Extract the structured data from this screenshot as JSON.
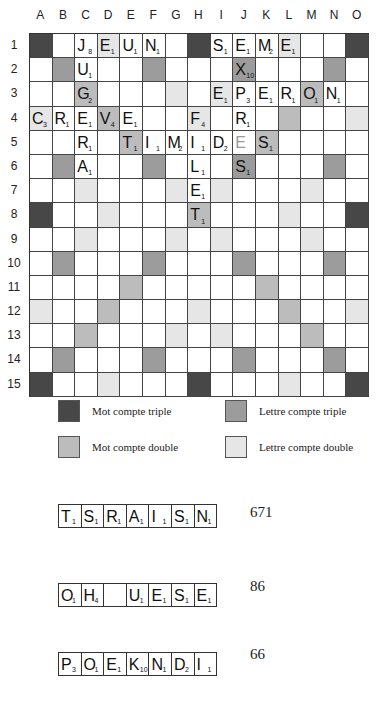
{
  "columns": [
    "A",
    "B",
    "C",
    "D",
    "E",
    "F",
    "G",
    "H",
    "I",
    "J",
    "K",
    "L",
    "M",
    "N",
    "O"
  ],
  "rows": [
    "1",
    "2",
    "3",
    "4",
    "5",
    "6",
    "7",
    "8",
    "9",
    "10",
    "11",
    "12",
    "13",
    "14",
    "15"
  ],
  "colors": {
    "TW": "#474747",
    "LT": "#9c9c9c",
    "DW": "#bcbcbc",
    "LD": "#e6e6e6"
  },
  "bonus_layout": [
    "TW..LD...TW...LD..TW",
    ""
  ],
  "bonus": [
    [
      "TW",
      "",
      "",
      "LD",
      "",
      "",
      "",
      "TW",
      "",
      "",
      "",
      "LD",
      "",
      "",
      "TW"
    ],
    [
      "",
      "LT",
      "",
      "",
      "",
      "LT",
      "",
      "",
      "",
      "LT",
      "",
      "",
      "",
      "LT",
      ""
    ],
    [
      "",
      "",
      "DW",
      "",
      "",
      "",
      "LD",
      "",
      "LD",
      "",
      "",
      "",
      "DW",
      "",
      ""
    ],
    [
      "LD",
      "",
      "",
      "DW",
      "",
      "",
      "",
      "LD",
      "",
      "",
      "",
      "DW",
      "",
      "",
      "LD"
    ],
    [
      "",
      "",
      "",
      "",
      "DW",
      "",
      "",
      "",
      "",
      "",
      "DW",
      "",
      "",
      "",
      ""
    ],
    [
      "",
      "LT",
      "",
      "",
      "",
      "LT",
      "",
      "",
      "",
      "LT",
      "",
      "",
      "",
      "LT",
      ""
    ],
    [
      "",
      "",
      "LD",
      "",
      "",
      "",
      "LD",
      "",
      "LD",
      "",
      "",
      "",
      "LD",
      "",
      ""
    ],
    [
      "TW",
      "",
      "",
      "LD",
      "",
      "",
      "",
      "DW",
      "",
      "",
      "",
      "LD",
      "",
      "",
      "TW"
    ],
    [
      "",
      "",
      "LD",
      "",
      "",
      "",
      "LD",
      "",
      "LD",
      "",
      "",
      "",
      "LD",
      "",
      ""
    ],
    [
      "",
      "LT",
      "",
      "",
      "",
      "LT",
      "",
      "",
      "",
      "LT",
      "",
      "",
      "",
      "LT",
      ""
    ],
    [
      "",
      "",
      "",
      "",
      "DW",
      "",
      "",
      "",
      "",
      "",
      "DW",
      "",
      "",
      "",
      ""
    ],
    [
      "LD",
      "",
      "",
      "DW",
      "",
      "",
      "",
      "LD",
      "",
      "",
      "",
      "DW",
      "",
      "",
      "LD"
    ],
    [
      "",
      "",
      "DW",
      "",
      "",
      "",
      "LD",
      "",
      "LD",
      "",
      "",
      "",
      "DW",
      "",
      ""
    ],
    [
      "",
      "LT",
      "",
      "",
      "",
      "LT",
      "",
      "",
      "",
      "LT",
      "",
      "",
      "",
      "LT",
      ""
    ],
    [
      "TW",
      "",
      "",
      "LD",
      "",
      "",
      "",
      "TW",
      "",
      "",
      "",
      "LD",
      "",
      "",
      "TW"
    ]
  ],
  "tiles": [
    {
      "r": 0,
      "c": 2,
      "l": "J",
      "v": "8"
    },
    {
      "r": 0,
      "c": 3,
      "l": "E",
      "v": "1"
    },
    {
      "r": 0,
      "c": 4,
      "l": "U",
      "v": "1"
    },
    {
      "r": 0,
      "c": 5,
      "l": "N",
      "v": "1"
    },
    {
      "r": 0,
      "c": 8,
      "l": "S",
      "v": "1"
    },
    {
      "r": 0,
      "c": 9,
      "l": "E",
      "v": "1"
    },
    {
      "r": 0,
      "c": 10,
      "l": "M",
      "v": "2"
    },
    {
      "r": 0,
      "c": 11,
      "l": "E",
      "v": "1"
    },
    {
      "r": 1,
      "c": 2,
      "l": "U",
      "v": "1"
    },
    {
      "r": 1,
      "c": 9,
      "l": "X",
      "v": "10"
    },
    {
      "r": 2,
      "c": 2,
      "l": "G",
      "v": "2"
    },
    {
      "r": 2,
      "c": 8,
      "l": "E",
      "v": "1"
    },
    {
      "r": 2,
      "c": 9,
      "l": "P",
      "v": "3"
    },
    {
      "r": 2,
      "c": 10,
      "l": "E",
      "v": "1"
    },
    {
      "r": 2,
      "c": 11,
      "l": "R",
      "v": "1"
    },
    {
      "r": 2,
      "c": 12,
      "l": "O",
      "v": "1"
    },
    {
      "r": 2,
      "c": 13,
      "l": "N",
      "v": "1"
    },
    {
      "r": 3,
      "c": 0,
      "l": "C",
      "v": "3"
    },
    {
      "r": 3,
      "c": 1,
      "l": "R",
      "v": "1"
    },
    {
      "r": 3,
      "c": 2,
      "l": "E",
      "v": "1"
    },
    {
      "r": 3,
      "c": 3,
      "l": "V",
      "v": "4"
    },
    {
      "r": 3,
      "c": 4,
      "l": "E",
      "v": "1"
    },
    {
      "r": 3,
      "c": 7,
      "l": "F",
      "v": "4"
    },
    {
      "r": 3,
      "c": 9,
      "l": "R",
      "v": "1"
    },
    {
      "r": 4,
      "c": 2,
      "l": "R",
      "v": "1"
    },
    {
      "r": 4,
      "c": 4,
      "l": "T",
      "v": "1"
    },
    {
      "r": 4,
      "c": 5,
      "l": "I",
      "v": "1"
    },
    {
      "r": 4,
      "c": 6,
      "l": "M",
      "v": "2"
    },
    {
      "r": 4,
      "c": 7,
      "l": "I",
      "v": "1"
    },
    {
      "r": 4,
      "c": 8,
      "l": "D",
      "v": "2"
    },
    {
      "r": 4,
      "c": 9,
      "l": "E",
      "v": "",
      "blank": true
    },
    {
      "r": 4,
      "c": 10,
      "l": "S",
      "v": "1"
    },
    {
      "r": 5,
      "c": 2,
      "l": "A",
      "v": "1"
    },
    {
      "r": 5,
      "c": 7,
      "l": "L",
      "v": "1"
    },
    {
      "r": 5,
      "c": 9,
      "l": "S",
      "v": "1"
    },
    {
      "r": 6,
      "c": 7,
      "l": "E",
      "v": "1"
    },
    {
      "r": 7,
      "c": 7,
      "l": "T",
      "v": "1"
    }
  ],
  "legend": [
    {
      "type": "TW",
      "label": "Mot compte triple"
    },
    {
      "type": "LT",
      "label": "Lettre compte triple"
    },
    {
      "type": "DW",
      "label": "Mot compte double"
    },
    {
      "type": "LD",
      "label": "Lettre compte double"
    }
  ],
  "racks": [
    {
      "tiles": [
        {
          "l": "T",
          "v": "1"
        },
        {
          "l": "S",
          "v": "1"
        },
        {
          "l": "R",
          "v": "1"
        },
        {
          "l": "A",
          "v": "1"
        },
        {
          "l": "I",
          "v": "1"
        },
        {
          "l": "S",
          "v": "1"
        },
        {
          "l": "N",
          "v": "1"
        }
      ],
      "score": "671"
    },
    {
      "tiles": [
        {
          "l": "O",
          "v": "1"
        },
        {
          "l": "H",
          "v": "4"
        },
        {
          "l": "",
          "v": ""
        },
        {
          "l": "U",
          "v": "1"
        },
        {
          "l": "E",
          "v": "1"
        },
        {
          "l": "S",
          "v": "1"
        },
        {
          "l": "E",
          "v": "1"
        }
      ],
      "score": "86"
    },
    {
      "tiles": [
        {
          "l": "P",
          "v": "3"
        },
        {
          "l": "O",
          "v": "1"
        },
        {
          "l": "E",
          "v": "1"
        },
        {
          "l": "K",
          "v": "10"
        },
        {
          "l": "N",
          "v": "1"
        },
        {
          "l": "D",
          "v": "2"
        },
        {
          "l": "I",
          "v": "1"
        }
      ],
      "score": "66"
    }
  ]
}
